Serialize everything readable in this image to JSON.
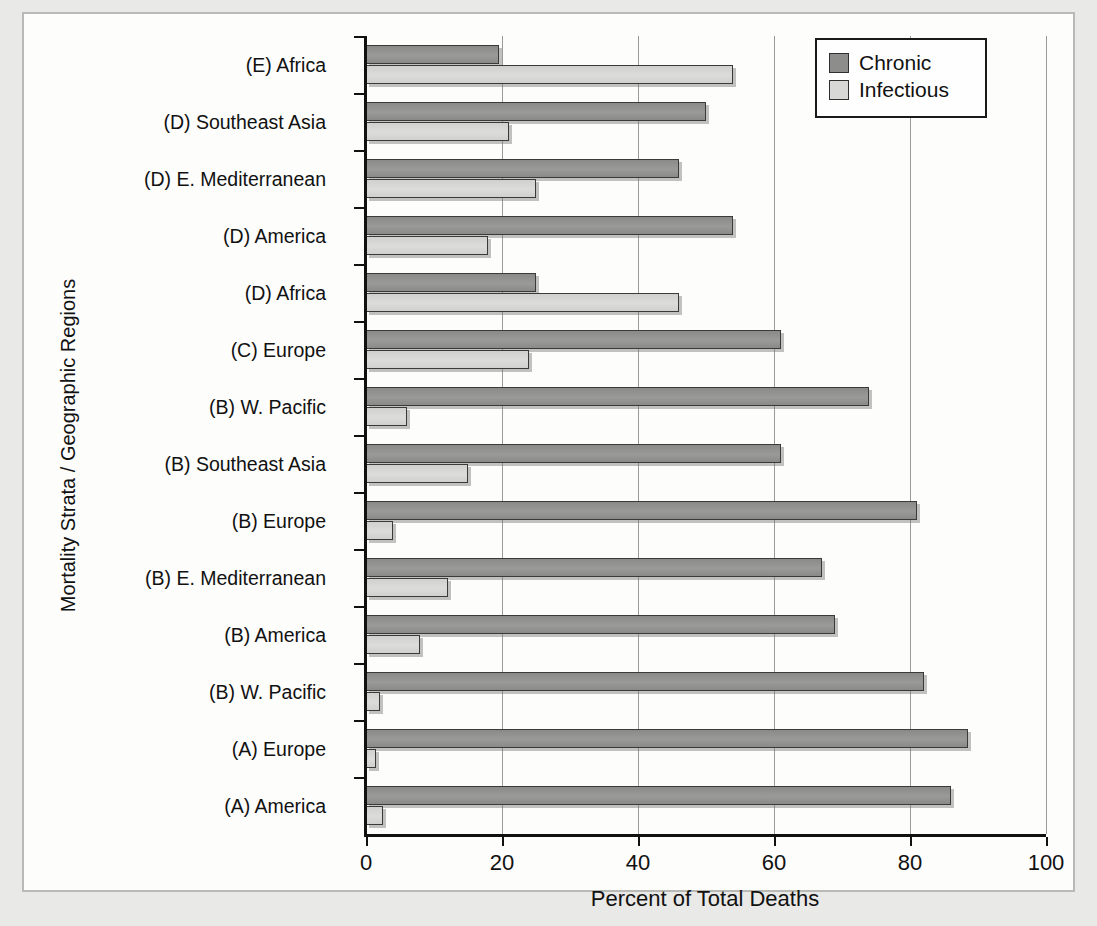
{
  "chart_data": {
    "type": "bar",
    "orientation": "horizontal",
    "title": "",
    "xlabel": "Percent of Total Deaths",
    "ylabel": "Mortality Strata / Geographic Regions",
    "xlim": [
      0,
      100
    ],
    "xticks": [
      0,
      20,
      40,
      60,
      80,
      100
    ],
    "grid": true,
    "legend_position": "top-right",
    "categories": [
      "(A) America",
      "(A) Europe",
      "(B) W. Pacific",
      "(B) America",
      "(B) E. Mediterranean",
      "(B) Europe",
      "(B) Southeast Asia",
      "(B) W. Pacific",
      "(C) Europe",
      "(D) Africa",
      "(D) America",
      "(D) E. Mediterranean",
      "(D) Southeast Asia",
      "(E) Africa"
    ],
    "series": [
      {
        "name": "Chronic",
        "color": "#8d8d8b",
        "values": [
          86,
          88.5,
          82,
          69,
          67,
          81,
          61,
          74,
          61,
          25,
          54,
          46,
          50,
          19.5
        ]
      },
      {
        "name": "Infectious",
        "color": "#d8d8d6",
        "values": [
          2.5,
          1.5,
          2,
          8,
          12,
          4,
          15,
          6,
          24,
          46,
          18,
          25,
          21,
          54
        ]
      }
    ]
  },
  "legend": {
    "items": [
      {
        "label": "Chronic",
        "color": "#8d8d8b"
      },
      {
        "label": "Infectious",
        "color": "#d8d8d6"
      }
    ]
  },
  "axes": {
    "x_title": "Percent of Total Deaths",
    "y_title": "Mortality Strata / Geographic Regions",
    "x_tick_labels": [
      "0",
      "20",
      "40",
      "60",
      "80",
      "100"
    ]
  }
}
